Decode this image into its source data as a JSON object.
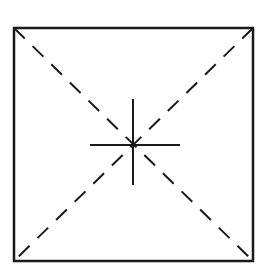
{
  "diagram": {
    "type": "geometric-figure",
    "canvas": {
      "width": 267,
      "height": 269,
      "background": "#ffffff"
    },
    "stroke_color": "#1a1a1a",
    "square": {
      "x1": 14,
      "y1": 28,
      "x2": 253,
      "y2": 261,
      "stroke_width": 2.5
    },
    "diagonals": [
      {
        "name": "top-left-to-bottom-right",
        "x1": 14,
        "y1": 28,
        "x2": 253,
        "y2": 261,
        "dash": "15 11",
        "stroke_width": 2
      },
      {
        "name": "top-right-to-bottom-left",
        "x1": 253,
        "y1": 28,
        "x2": 14,
        "y2": 261,
        "dash": "15 11",
        "stroke_width": 2
      }
    ],
    "crosshair": {
      "center": {
        "x": 133,
        "y": 145
      },
      "horizontal": {
        "x1": 90,
        "y1": 145,
        "x2": 180,
        "y2": 145
      },
      "vertical": {
        "x1": 133,
        "y1": 99,
        "x2": 133,
        "y2": 185
      },
      "stroke_width": 2
    }
  }
}
